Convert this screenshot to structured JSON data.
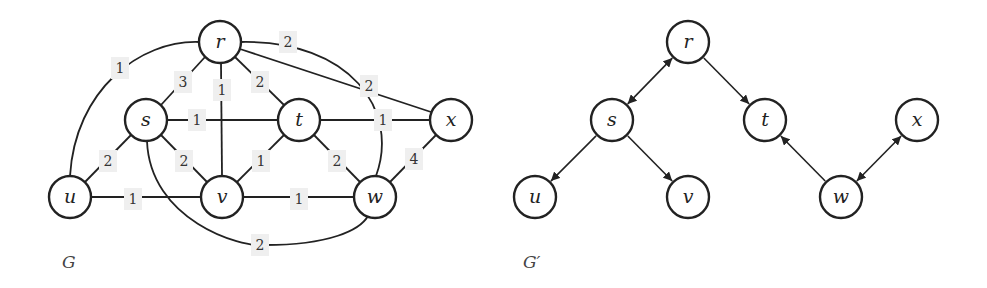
{
  "graphs": [
    {
      "id": "G",
      "caption": "G",
      "caption_pos": [
        62,
        268
      ],
      "directed": false,
      "nodes": [
        {
          "id": "r",
          "label": "r",
          "x": 220,
          "y": 42
        },
        {
          "id": "s",
          "label": "s",
          "x": 146,
          "y": 120
        },
        {
          "id": "t",
          "label": "t",
          "x": 299,
          "y": 120
        },
        {
          "id": "x",
          "label": "x",
          "x": 451,
          "y": 120
        },
        {
          "id": "u",
          "label": "u",
          "x": 70,
          "y": 197
        },
        {
          "id": "v",
          "label": "v",
          "x": 222,
          "y": 197
        },
        {
          "id": "w",
          "label": "w",
          "x": 375,
          "y": 197
        }
      ],
      "edges": [
        {
          "from": "r",
          "to": "u",
          "weight": "1",
          "path": "M199,42 C140,40 75,90 70,176",
          "label_pos": [
            120,
            68
          ]
        },
        {
          "from": "r",
          "to": "s",
          "weight": "3",
          "path": "M205,57 L161,105",
          "label_pos": [
            183,
            82
          ]
        },
        {
          "from": "r",
          "to": "v",
          "weight": "1",
          "path": "M221,63 L222,176",
          "label_pos": [
            222,
            90
          ]
        },
        {
          "from": "r",
          "to": "t",
          "weight": "2",
          "path": "M235,57 L284,105",
          "label_pos": [
            260,
            82
          ]
        },
        {
          "from": "r",
          "to": "w",
          "weight": "2",
          "path": "M241,42 C350,40 400,110 376,176",
          "label_pos": [
            288,
            42
          ]
        },
        {
          "from": "r",
          "to": "x",
          "weight": "2",
          "path": "M240,49 L431,112",
          "label_pos": [
            369,
            86
          ]
        },
        {
          "from": "s",
          "to": "t",
          "weight": "1",
          "path": "M167,120 L278,120",
          "label_pos": [
            197,
            120
          ]
        },
        {
          "from": "s",
          "to": "u",
          "weight": "2",
          "path": "M131,135 L85,182",
          "label_pos": [
            108,
            161
          ]
        },
        {
          "from": "s",
          "to": "v",
          "weight": "2",
          "path": "M161,135 L207,182",
          "label_pos": [
            184,
            161
          ]
        },
        {
          "from": "s",
          "to": "w",
          "weight": "2",
          "path": "M147,141 C150,220 240,248 265,245 C330,245 360,230 368,216",
          "label_pos": [
            260,
            245
          ]
        },
        {
          "from": "t",
          "to": "x",
          "weight": "1",
          "path": "M320,120 L430,120",
          "label_pos": [
            383,
            120
          ]
        },
        {
          "from": "t",
          "to": "v",
          "weight": "1",
          "path": "M284,135 L237,182",
          "label_pos": [
            261,
            161
          ]
        },
        {
          "from": "t",
          "to": "w",
          "weight": "2",
          "path": "M314,135 L360,182",
          "label_pos": [
            337,
            161
          ]
        },
        {
          "from": "x",
          "to": "w",
          "weight": "4",
          "path": "M436,135 L390,182",
          "label_pos": [
            414,
            159
          ]
        },
        {
          "from": "u",
          "to": "v",
          "weight": "1",
          "path": "M91,197 L201,197",
          "label_pos": [
            133,
            199
          ]
        },
        {
          "from": "v",
          "to": "w",
          "weight": "1",
          "path": "M243,197 L354,197",
          "label_pos": [
            299,
            199
          ]
        }
      ]
    },
    {
      "id": "G_prime",
      "caption": "G′",
      "caption_pos": [
        523,
        268
      ],
      "directed": true,
      "nodes": [
        {
          "id": "r",
          "label": "r",
          "x": 688,
          "y": 42
        },
        {
          "id": "s",
          "label": "s",
          "x": 612,
          "y": 120
        },
        {
          "id": "t",
          "label": "t",
          "x": 765,
          "y": 120
        },
        {
          "id": "x",
          "label": "x",
          "x": 917,
          "y": 120
        },
        {
          "id": "u",
          "label": "u",
          "x": 535,
          "y": 197
        },
        {
          "id": "v",
          "label": "v",
          "x": 688,
          "y": 197
        },
        {
          "id": "w",
          "label": "w",
          "x": 841,
          "y": 197
        }
      ],
      "edges": [
        {
          "from": "r",
          "to": "s",
          "arrow_start": true,
          "arrow_end": true
        },
        {
          "from": "r",
          "to": "t",
          "arrow_start": false,
          "arrow_end": true
        },
        {
          "from": "s",
          "to": "u",
          "arrow_start": false,
          "arrow_end": true
        },
        {
          "from": "s",
          "to": "v",
          "arrow_start": false,
          "arrow_end": true
        },
        {
          "from": "w",
          "to": "t",
          "arrow_start": false,
          "arrow_end": true
        },
        {
          "from": "w",
          "to": "x",
          "arrow_start": true,
          "arrow_end": true
        }
      ]
    }
  ],
  "node_radius": 21,
  "colors": {
    "stroke": "#222222",
    "weight_bg": "#efefef",
    "caption": "#444444"
  }
}
